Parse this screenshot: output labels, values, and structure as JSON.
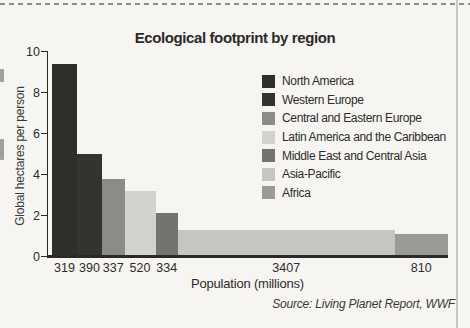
{
  "chart_data": {
    "type": "bar",
    "variant": "variable-width-bar",
    "title": "Ecological footprint by region",
    "xlabel": "Population (millions)",
    "ylabel": "Global hectares per person",
    "source": "Source: Living Planet Report, WWF",
    "ylim": [
      0,
      10
    ],
    "yticks": [
      0,
      2,
      4,
      6,
      8,
      10
    ],
    "grid": false,
    "legend_position": "upper right",
    "bar_width_encodes": "population_millions",
    "bar_height_encodes": "gha_per_person",
    "series": [
      {
        "region": "North America",
        "population_millions": 319,
        "gha_per_person": 9.4,
        "color": "#2f2e2c"
      },
      {
        "region": "Western Europe",
        "population_millions": 390,
        "gha_per_person": 5.0,
        "color": "#343330"
      },
      {
        "region": "Central and Eastern Europe",
        "population_millions": 337,
        "gha_per_person": 3.8,
        "color": "#8c8b88"
      },
      {
        "region": "Latin America and the Caribbean",
        "population_millions": 520,
        "gha_per_person": 3.2,
        "color": "#d3d2cd"
      },
      {
        "region": "Middle East and Central Asia",
        "population_millions": 334,
        "gha_per_person": 2.1,
        "color": "#747370"
      },
      {
        "region": "Asia-Pacific",
        "population_millions": 3407,
        "gha_per_person": 1.3,
        "color": "#c6c5c0"
      },
      {
        "region": "Africa",
        "population_millions": 810,
        "gha_per_person": 1.1,
        "color": "#9b9a95"
      }
    ],
    "layout_hints": {
      "bar_px_widths": [
        25,
        25,
        22.5,
        31,
        22.5,
        216.5,
        53.5
      ],
      "px_per_unit": 20.5,
      "baseline_y_px": 256.5,
      "bars_start_x_px": 52
    }
  }
}
